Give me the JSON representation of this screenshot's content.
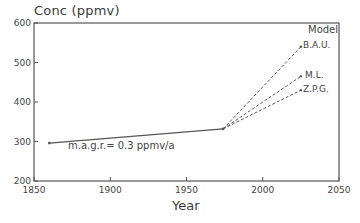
{
  "chart_data": {
    "type": "line",
    "title": "",
    "xlabel": "Year",
    "ylabel": "Conc (ppmv)",
    "xlim": [
      1850,
      2050
    ],
    "ylim": [
      200,
      600
    ],
    "x_ticks": [
      1850,
      1900,
      1950,
      2000,
      2050
    ],
    "y_ticks": [
      200,
      300,
      400,
      500,
      600
    ],
    "grid": false,
    "legend_title": "Model",
    "legend_position": "upper right (inline labels at line ends)",
    "historical": {
      "name": "observed",
      "style": "solid",
      "x": [
        1860,
        1974
      ],
      "y": [
        296,
        332
      ]
    },
    "series": [
      {
        "name": "B.A.U.",
        "style": "dashed",
        "x": [
          1974,
          2025
        ],
        "y": [
          332,
          540
        ]
      },
      {
        "name": "M.L.",
        "style": "dashed",
        "x": [
          1974,
          2025
        ],
        "y": [
          332,
          465
        ]
      },
      {
        "name": "Z.P.G.",
        "style": "dashed",
        "x": [
          1974,
          2025
        ],
        "y": [
          332,
          430
        ]
      }
    ],
    "annotations": [
      {
        "text": "m.a.g.r.= 0.3 ppmv/a",
        "x": 1875,
        "y": 290
      }
    ]
  },
  "labels": {
    "ylabel": "Conc (ppmv)",
    "xlabel": "Year",
    "legend_title": "Model",
    "annotation": "m.a.g.r.= 0.3 ppmv/a",
    "series_bau": "B.A.U.",
    "series_ml": "M.L.",
    "series_zpg": "Z.P.G."
  },
  "colors": {
    "axis": "#555555",
    "line": "#555555",
    "text": "#444444"
  }
}
